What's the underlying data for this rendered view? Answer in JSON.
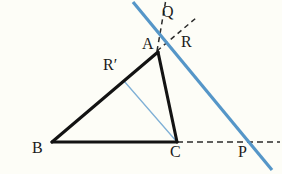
{
  "figure": {
    "kind": "geometry-diagram",
    "background_color": "#fdfdf7",
    "width": 282,
    "height": 174,
    "stroke_colors": {
      "solid_black": "#131313",
      "dashed_black": "#2b2b2b",
      "blue_line": "#5596c8",
      "thin_blue": "#7fb0d6"
    },
    "labels": {
      "Q": "Q",
      "A": "A",
      "R": "R",
      "R_prime": "R′",
      "B": "B",
      "C": "C",
      "P": "P"
    },
    "points": {
      "A": {
        "x": 158,
        "y": 52
      },
      "B": {
        "x": 52,
        "y": 142
      },
      "C": {
        "x": 177,
        "y": 142
      },
      "P": {
        "x": 245,
        "y": 142
      },
      "Q": {
        "x": 163,
        "y": 16
      },
      "R": {
        "x": 172,
        "y": 38
      },
      "R_prime": {
        "x": 124,
        "y": 81
      }
    },
    "label_positions": {
      "Q": {
        "x": 162,
        "y": 4
      },
      "A": {
        "x": 142,
        "y": 36
      },
      "R": {
        "x": 181,
        "y": 34
      },
      "R_prime": {
        "x": 103,
        "y": 57
      },
      "B": {
        "x": 32,
        "y": 140
      },
      "C": {
        "x": 170,
        "y": 144
      },
      "P": {
        "x": 238,
        "y": 144
      }
    },
    "segments": [
      {
        "name": "side-AB",
        "style": "solid-thick",
        "x1": 158,
        "y1": 52,
        "x2": 52,
        "y2": 142
      },
      {
        "name": "side-BC",
        "style": "solid-thick",
        "x1": 52,
        "y1": 142,
        "x2": 177,
        "y2": 142
      },
      {
        "name": "side-AC",
        "style": "solid-thick",
        "x1": 158,
        "y1": 52,
        "x2": 177,
        "y2": 142
      },
      {
        "name": "cevian-Rprime-C",
        "style": "thin-blue",
        "x1": 124,
        "y1": 81,
        "x2": 177,
        "y2": 142
      },
      {
        "name": "ray-A-to-Q",
        "style": "dashed",
        "x1": 157,
        "y1": 50,
        "x2": 165,
        "y2": 2
      },
      {
        "name": "ray-A-through-R",
        "style": "dashed",
        "x1": 157,
        "y1": 50,
        "x2": 196,
        "y2": 18
      },
      {
        "name": "ray-C-to-P-extended",
        "style": "dashed",
        "x1": 177,
        "y1": 142,
        "x2": 280,
        "y2": 142
      },
      {
        "name": "transversal-blue-QP",
        "style": "blue-thick",
        "x1": 133,
        "y1": 2,
        "x2": 272,
        "y2": 170
      }
    ]
  }
}
